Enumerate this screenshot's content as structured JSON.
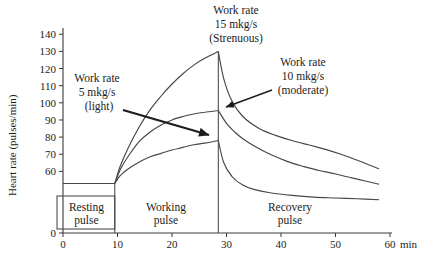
{
  "figure": {
    "ylabel": "Heart rate (pulses/min)",
    "x_axis_unit": "min"
  },
  "annotations": {
    "strenuous": {
      "lines": [
        "Work rate",
        "15 mkg/s",
        "(Strenuous)"
      ]
    },
    "moderate": {
      "lines": [
        "Work rate",
        "10 mkg/s",
        "(moderate)"
      ]
    },
    "light": {
      "lines": [
        "Work rate",
        "5 mkg/s",
        "(light)"
      ]
    }
  },
  "phases": {
    "resting": {
      "line1": "Resting",
      "line2": "pulse"
    },
    "working": {
      "line1": "Working",
      "line2": "pulse"
    },
    "recovery": {
      "line1": "Recovery",
      "line2": "pulse"
    }
  },
  "colors": {
    "line": "#474747",
    "text": "#1c1c1c",
    "background": "#ffffff"
  },
  "chart_data": {
    "type": "line",
    "title": "",
    "ylabel": "Heart rate (pulses/min)",
    "xlabel": "min",
    "x_ticks": [
      0,
      10,
      20,
      30,
      40,
      50,
      60
    ],
    "y_ticks": [
      0,
      60,
      70,
      80,
      90,
      100,
      110,
      120,
      130,
      140
    ],
    "ylim": [
      0,
      140
    ],
    "xlim": [
      0,
      60
    ],
    "axis_note": "y-axis compressed between 0 and 60 (break at bottom)",
    "rest_end_time_min": 9.5,
    "work_end_time_min": 28.5,
    "resting_level": 53,
    "series": [
      {
        "name": "Work rate 5 mkg/s (light)",
        "work": [
          [
            9.5,
            53
          ],
          [
            10.5,
            57.5
          ],
          [
            12,
            61.5
          ],
          [
            14,
            65.5
          ],
          [
            16,
            68.5
          ],
          [
            18,
            70.5
          ],
          [
            20,
            72.5
          ],
          [
            22,
            74
          ],
          [
            24,
            75.5
          ],
          [
            26,
            76.5
          ],
          [
            28.5,
            78
          ]
        ],
        "recovery": [
          [
            28.5,
            78
          ],
          [
            29.5,
            65
          ],
          [
            31,
            57
          ],
          [
            33,
            52
          ],
          [
            35,
            49.5
          ],
          [
            38,
            47.5
          ],
          [
            42,
            46
          ],
          [
            46,
            45
          ],
          [
            50,
            44.5
          ],
          [
            54,
            44
          ],
          [
            58,
            43.5
          ]
        ]
      },
      {
        "name": "Work rate 10 mkg/s (moderate)",
        "work": [
          [
            9.5,
            53
          ],
          [
            10.5,
            61
          ],
          [
            12,
            69
          ],
          [
            14,
            77.5
          ],
          [
            16,
            83
          ],
          [
            18,
            87
          ],
          [
            20,
            90
          ],
          [
            22,
            92
          ],
          [
            24,
            93.5
          ],
          [
            26,
            94.5
          ],
          [
            28.5,
            95.5
          ]
        ],
        "recovery": [
          [
            28.5,
            95.5
          ],
          [
            30,
            88
          ],
          [
            31.5,
            83
          ],
          [
            33,
            79
          ],
          [
            35,
            75
          ],
          [
            38,
            70
          ],
          [
            41,
            66
          ],
          [
            44,
            63
          ],
          [
            47,
            60.5
          ],
          [
            50,
            58.5
          ],
          [
            54,
            55.5
          ],
          [
            58,
            52.5
          ]
        ]
      },
      {
        "name": "Work rate 15 mkg/s (Strenuous)",
        "work": [
          [
            9.5,
            53
          ],
          [
            10.5,
            63
          ],
          [
            12,
            74
          ],
          [
            14,
            86
          ],
          [
            16,
            96
          ],
          [
            18,
            104
          ],
          [
            20,
            111
          ],
          [
            22,
            117
          ],
          [
            24,
            122
          ],
          [
            26,
            126
          ],
          [
            28.5,
            130
          ]
        ],
        "recovery": [
          [
            28.5,
            130
          ],
          [
            29.5,
            114
          ],
          [
            31,
            101
          ],
          [
            33,
            92
          ],
          [
            36,
            85
          ],
          [
            39,
            81
          ],
          [
            42,
            78
          ],
          [
            45,
            75.5
          ],
          [
            48,
            73
          ],
          [
            51,
            70
          ],
          [
            54,
            66.5
          ],
          [
            58,
            61.5
          ]
        ]
      }
    ]
  }
}
